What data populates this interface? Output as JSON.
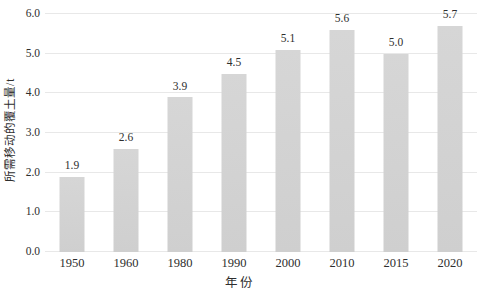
{
  "chart_data": {
    "type": "bar",
    "categories": [
      "1950",
      "1960",
      "1980",
      "1990",
      "2000",
      "2010",
      "2015",
      "2020"
    ],
    "values": [
      1.9,
      2.6,
      3.9,
      4.5,
      5.1,
      5.6,
      5.0,
      5.7
    ],
    "value_labels": [
      "1.9",
      "2.6",
      "3.9",
      "4.5",
      "5.1",
      "5.6",
      "5.0",
      "5.7"
    ],
    "title": "",
    "xlabel": "年份",
    "ylabel": "所需移动的覆土量/t",
    "ylim": [
      0,
      6
    ],
    "ytick_step": 1,
    "ytick_labels": [
      "0.0",
      "1.0",
      "2.0",
      "3.0",
      "4.0",
      "5.0",
      "6.0"
    ],
    "grid": true,
    "legend": "none",
    "colors": {
      "bar_fill": "#d2d2d2",
      "gridline": "#e8e8e8",
      "text": "#2e2e2e",
      "background": "#ffffff"
    }
  }
}
